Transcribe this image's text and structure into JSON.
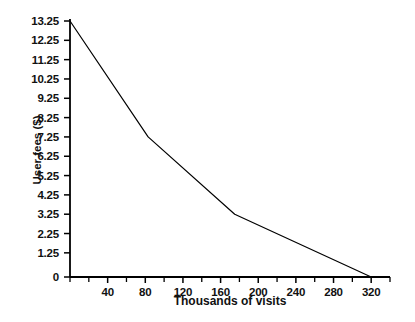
{
  "chart_data": {
    "type": "line",
    "title": "",
    "xlabel": "Thousands of visits",
    "ylabel": "User fees ($)",
    "xlim": [
      0,
      340
    ],
    "ylim": [
      0,
      13.25
    ],
    "grid": false,
    "legend": null,
    "x_ticks": [
      40,
      80,
      120,
      160,
      200,
      240,
      280,
      320
    ],
    "x_tick_labels": [
      "40",
      "80",
      "120",
      "160",
      "200",
      "240",
      "280",
      "320"
    ],
    "x_minor_ticks": [
      0,
      20,
      60,
      100,
      140,
      180,
      220,
      260,
      300,
      340
    ],
    "y_ticks": [
      0,
      1.25,
      2.25,
      3.25,
      4.25,
      5.25,
      6.25,
      7.25,
      8.25,
      9.25,
      10.25,
      11.25,
      12.25,
      13.25
    ],
    "y_tick_labels": [
      "0",
      "1.25",
      "2.25",
      "3.25",
      "4.25",
      "5.25",
      "6.25",
      "7.25",
      "8.25",
      "9.25",
      "10.25",
      "11.25",
      "12.25",
      "13.25"
    ],
    "series": [
      {
        "name": "User fees vs visits",
        "x": [
          0,
          83,
          175,
          320
        ],
        "y": [
          13.25,
          7.25,
          3.25,
          0
        ],
        "color": "#000000",
        "line_width": 1.2
      }
    ]
  },
  "axes": {
    "axis_color": "#000000",
    "background": "#ffffff"
  }
}
